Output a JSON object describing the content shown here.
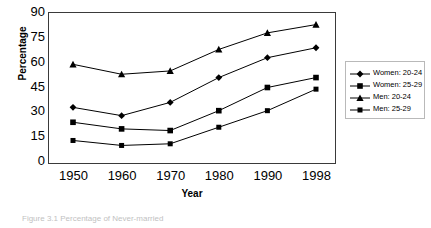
{
  "chart_data": {
    "type": "line",
    "title": "",
    "xlabel": "Year",
    "ylabel": "Percentage",
    "categories": [
      "1950",
      "1960",
      "1970",
      "1980",
      "1990",
      "1998"
    ],
    "x": [
      1950,
      1960,
      1970,
      1980,
      1990,
      1998
    ],
    "xtick_labels": [
      "1950",
      "1960",
      "1970",
      "1980",
      "1990",
      "1998"
    ],
    "ytick_labels": [
      "0",
      "15",
      "30",
      "45",
      "60",
      "75",
      "90"
    ],
    "yticks": [
      0,
      15,
      30,
      45,
      60,
      75,
      90
    ],
    "ylim": [
      0,
      90
    ],
    "grid": false,
    "legend_position": "right-outside",
    "series": [
      {
        "name": "Women: 20-24",
        "marker": "diamond",
        "values": [
          33,
          28,
          36,
          51,
          63,
          69
        ]
      },
      {
        "name": "Women: 25-29",
        "marker": "square",
        "values": [
          24,
          20,
          19,
          31,
          45,
          51
        ]
      },
      {
        "name": "Men: 20-24",
        "marker": "triangle",
        "values": [
          59,
          53,
          55,
          68,
          78,
          83
        ]
      },
      {
        "name": "Men: 25-29",
        "marker": "small-square",
        "values": [
          13,
          10,
          11,
          21,
          31,
          44
        ]
      }
    ],
    "line_color": "#000000",
    "frame_color": "#3a3a3a"
  },
  "caption": {
    "text": "Figure 3.1  Percentage of Never-married"
  }
}
